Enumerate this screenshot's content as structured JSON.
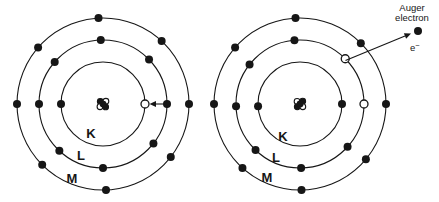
{
  "figure": {
    "width": 439,
    "height": 202,
    "background": "#ffffff",
    "ink": "#161616"
  },
  "annotations": {
    "auger_line1": "Auger",
    "auger_line2": "electron",
    "electron_symbol_base": "e",
    "electron_symbol_sup": "−"
  },
  "atoms": [
    {
      "id": "before",
      "center": {
        "x": 103,
        "y": 104
      },
      "electron_radius": 4,
      "nucleus": {
        "radius": 2.9,
        "nucleons": [
          {
            "dx": -2.7,
            "dy": -2.5,
            "type": "solid"
          },
          {
            "dx": 2.9,
            "dy": -2.7,
            "type": "open"
          },
          {
            "dx": -3.0,
            "dy": 2.7,
            "type": "open"
          },
          {
            "dx": 2.6,
            "dy": 2.9,
            "type": "solid"
          },
          {
            "dx": 0.1,
            "dy": 0.1,
            "type": "solid"
          }
        ]
      },
      "shells": [
        {
          "name": "K",
          "label": "K",
          "radius": 42,
          "electrons_deg": [
            180
          ],
          "vacancies_deg": [
            0
          ]
        },
        {
          "name": "L",
          "label": "L",
          "radius": 64,
          "electrons_deg": [
            0,
            44,
            92,
            139,
            180,
            227,
            270,
            322
          ],
          "vacancies_deg": []
        },
        {
          "name": "M",
          "label": "M",
          "radius": 86,
          "electrons_deg": [
            0,
            47,
            93,
            139,
            180,
            225,
            272,
            322
          ],
          "vacancies_deg": []
        }
      ],
      "arrows": [
        {
          "name": "l-to-k-transition-arrow",
          "x1": 163.5,
          "y1": 104,
          "x2": 149.5,
          "y2": 104
        }
      ]
    },
    {
      "id": "after",
      "center": {
        "x": 300,
        "y": 104
      },
      "electron_radius": 4,
      "nucleus": {
        "radius": 2.9,
        "nucleons": [
          {
            "dx": -2.9,
            "dy": -2.6,
            "type": "open"
          },
          {
            "dx": 2.7,
            "dy": -2.8,
            "type": "solid"
          },
          {
            "dx": -2.7,
            "dy": 2.8,
            "type": "solid"
          },
          {
            "dx": 2.8,
            "dy": 2.7,
            "type": "open"
          },
          {
            "dx": 0.1,
            "dy": 0.0,
            "type": "solid"
          }
        ]
      },
      "shells": [
        {
          "name": "K",
          "label": "K",
          "radius": 42,
          "electrons_deg": [
            0,
            183
          ],
          "vacancies_deg": []
        },
        {
          "name": "L",
          "label": "L",
          "radius": 64,
          "electrons_deg": [
            95,
            142,
            182,
            226,
            271,
            318
          ],
          "vacancies_deg": [
            0,
            45
          ]
        },
        {
          "name": "M",
          "label": "M",
          "radius": 86,
          "electrons_deg": [
            0,
            45,
            93,
            139,
            180,
            228,
            271,
            320
          ],
          "vacancies_deg": []
        }
      ],
      "arrows": [
        {
          "name": "auger-ejection-arrow",
          "x1": 345.5,
          "y1": 60.5,
          "x2": 411,
          "y2": 33.5
        }
      ],
      "ejected_electron": {
        "x": 418,
        "y": 31
      }
    }
  ]
}
